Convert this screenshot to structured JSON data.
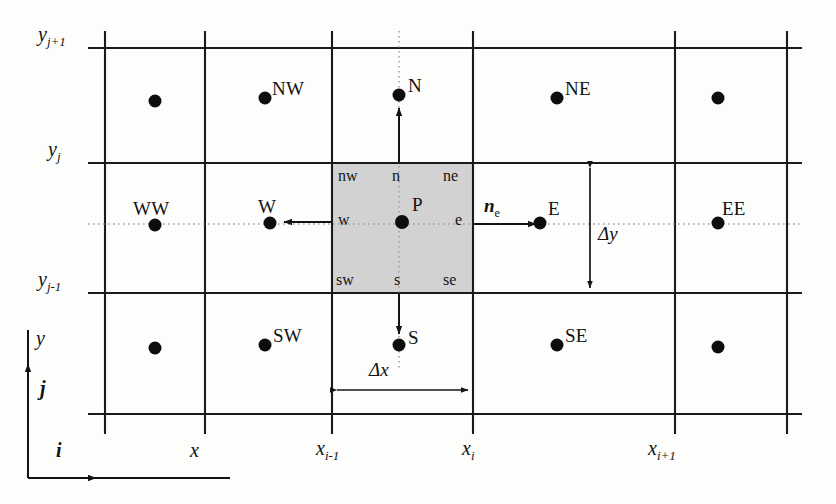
{
  "figure": {
    "background_color": "#fdfdfc",
    "line_color": "#1a1a1a",
    "dotted_color": "#9a9a9a",
    "control_volume_fill": "#d2d2d2",
    "node_color": "#0d0d0d"
  },
  "grid": {
    "vertical_lines_x": [
      105,
      205,
      332,
      473,
      675,
      787
    ],
    "horizontal_lines_y": [
      48,
      163,
      293,
      414
    ],
    "vertical_extent": [
      31,
      434
    ],
    "horizontal_extent": [
      88,
      802
    ]
  },
  "control_volume": {
    "x0": 332,
    "y0": 163,
    "x1": 473,
    "y1": 293,
    "center_node": "P"
  },
  "nodes": [
    {
      "name": "cv-node-P",
      "label": "P",
      "x": 402,
      "y": 222,
      "label_dx": 10,
      "label_dy": -20
    },
    {
      "name": "node-N",
      "label": "N",
      "x": 399,
      "y": 95,
      "label_dx": 9,
      "label_dy": -22
    },
    {
      "name": "node-S",
      "label": "S",
      "x": 399,
      "y": 345,
      "label_dx": 9,
      "label_dy": -20
    },
    {
      "name": "node-W",
      "label": "W",
      "x": 270,
      "y": 222,
      "label_dx": 2,
      "label_dy": -26
    },
    {
      "name": "node-E",
      "label": "E",
      "x": 540,
      "y": 222,
      "label_dx": 8,
      "label_dy": -22
    },
    {
      "name": "node-NW",
      "label": "NW",
      "x": 265,
      "y": 98,
      "label_dx": 7,
      "label_dy": -23
    },
    {
      "name": "node-NE",
      "label": "NE",
      "x": 557,
      "y": 98,
      "label_dx": 8,
      "label_dy": -23
    },
    {
      "name": "node-SW",
      "label": "SW",
      "x": 265,
      "y": 345,
      "label_dx": 8,
      "label_dy": -21
    },
    {
      "name": "node-SE",
      "label": "SE",
      "x": 557,
      "y": 345,
      "label_dx": 8,
      "label_dy": -21
    },
    {
      "name": "node-WW",
      "label": "WW",
      "x": 155,
      "y": 225,
      "label_dx": -18,
      "label_dy": -26
    },
    {
      "name": "node-EE",
      "label": "EE",
      "x": 718,
      "y": 222,
      "label_dx": 6,
      "label_dy": -24
    },
    {
      "name": "node-nw-corner-plain",
      "label": "",
      "x": 155,
      "y": 101,
      "label_dx": 0,
      "label_dy": 0
    },
    {
      "name": "node-ne-corner-plain",
      "label": "",
      "x": 718,
      "y": 98,
      "label_dx": 0,
      "label_dy": 0
    },
    {
      "name": "node-sw-corner-plain",
      "label": "",
      "x": 155,
      "y": 348,
      "label_dx": 0,
      "label_dy": 0
    },
    {
      "name": "node-se-corner-plain",
      "label": "",
      "x": 718,
      "y": 347,
      "label_dx": 0,
      "label_dy": 0
    }
  ],
  "face_labels": [
    {
      "name": "face-label-nw",
      "text": "nw",
      "x": 338,
      "y": 168
    },
    {
      "name": "face-label-n",
      "text": "n",
      "x": 393,
      "y": 168
    },
    {
      "name": "face-label-ne",
      "text": "ne",
      "x": 443,
      "y": 168
    },
    {
      "name": "face-label-w",
      "text": "w",
      "x": 338,
      "y": 213
    },
    {
      "name": "face-label-e",
      "text": "e",
      "x": 452,
      "y": 213
    },
    {
      "name": "face-label-sw",
      "text": "sw",
      "x": 336,
      "y": 272
    },
    {
      "name": "face-label-s",
      "text": "s",
      "x": 394,
      "y": 272
    },
    {
      "name": "face-label-se",
      "text": "se",
      "x": 443,
      "y": 272
    }
  ],
  "axis_ticks": {
    "y_labels": [
      {
        "name": "y-tick-j-plus-1",
        "base": "y",
        "sub": "j+1",
        "x": 38,
        "y": 36
      },
      {
        "name": "y-tick-j",
        "base": "y",
        "sub": "j",
        "x": 44,
        "y": 151
      },
      {
        "name": "y-tick-j-minus-1",
        "base": "y",
        "sub": "j-1",
        "x": 38,
        "y": 281
      }
    ],
    "x_labels": [
      {
        "name": "x-tick-x",
        "base": "x",
        "sub": "",
        "x": 192,
        "y": 452
      },
      {
        "name": "x-tick-i-minus-1",
        "base": "x",
        "sub": "i-1",
        "x": 318,
        "y": 450
      },
      {
        "name": "x-tick-i",
        "base": "x",
        "sub": "i",
        "x": 462,
        "y": 450
      },
      {
        "name": "x-tick-i-plus-1",
        "base": "x",
        "sub": "i+1",
        "x": 650,
        "y": 450
      }
    ]
  },
  "axes": {
    "y_axis_label": "y",
    "j_axis_label": "j",
    "i_axis_label": "i",
    "x_axis_label": "x",
    "y_axis_label_pos": {
      "x": 32,
      "y": 338
    },
    "j_axis_label_pos": {
      "x": 35,
      "y": 389
    },
    "i_axis_label_pos": {
      "x": 56,
      "y": 452
    },
    "vertical_line": {
      "x": 28,
      "y_top": 330,
      "y_bottom": 478
    },
    "horizontal_line": {
      "y": 478,
      "x_left": 28,
      "x_right": 230
    },
    "j_arrow_y": 372,
    "i_arrow_x": 96
  },
  "dimensions": [
    {
      "name": "dimension-delta-y",
      "label": "Δy",
      "orientation": "vertical",
      "x": 590,
      "y_start": 163,
      "y_end": 293,
      "label_x": 598,
      "label_y": 230
    },
    {
      "name": "dimension-delta-x",
      "label": "Δx",
      "orientation": "horizontal",
      "y": 390,
      "x_start": 332,
      "x_end": 473,
      "label_x": 370,
      "label_y": 362
    }
  ],
  "vectors": [
    {
      "name": "normal-vector-ne",
      "base": "n",
      "sub": "e",
      "label_x": 484,
      "label_y": 200,
      "arrow": {
        "x_start": 473,
        "y": 224,
        "x_end": 541
      }
    }
  ],
  "direction_arrows": [
    {
      "name": "arrow-to-N",
      "from_x": 399,
      "from_y": 163,
      "to_x": 399,
      "to_y": 104
    },
    {
      "name": "arrow-to-S",
      "from_x": 399,
      "from_y": 293,
      "to_x": 399,
      "to_y": 338
    },
    {
      "name": "arrow-to-W",
      "from_x": 332,
      "from_y": 222,
      "to_x": 279,
      "to_y": 222
    }
  ],
  "dotted_guides": {
    "horizontal_y": 224,
    "horizontal_x_start": 88,
    "horizontal_x_end": 800,
    "vertical_x": 399,
    "vertical_y_start": 31,
    "vertical_y_end": 368
  }
}
